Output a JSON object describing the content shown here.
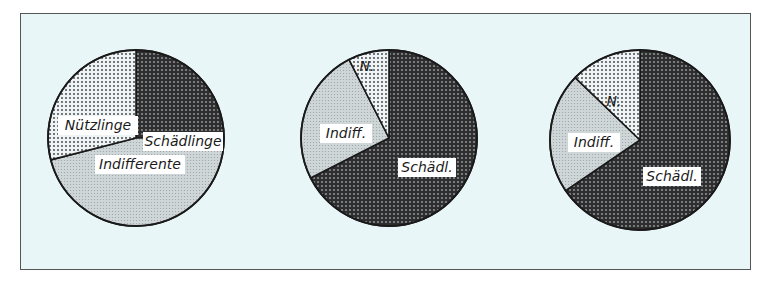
{
  "colors": {
    "background": "#e9f6f8",
    "frame_border": "#555555",
    "schaedlinge": "#4a4a4a",
    "indifferente": "#c9d0d2",
    "nuetzlinge": "#e6ecee",
    "outline": "#1a1a1a",
    "label_bg": "#ffffff"
  },
  "chart_data": [
    {
      "type": "pie",
      "title": "",
      "start_angle_deg": 0,
      "direction": "clockwise",
      "center": [
        136,
        138
      ],
      "radius": 88,
      "slices": [
        {
          "label": "Schädlinge",
          "value": 25,
          "pattern": "dark-dots"
        },
        {
          "label": "Indifferente",
          "value": 46,
          "pattern": "light-grey"
        },
        {
          "label": "Nützlinge",
          "value": 29,
          "pattern": "light-dots"
        }
      ]
    },
    {
      "type": "pie",
      "title": "",
      "start_angle_deg": 0,
      "direction": "clockwise",
      "center": [
        389,
        138
      ],
      "radius": 88,
      "slices": [
        {
          "label": "Schädl.",
          "value": 67.5,
          "pattern": "dark-dots"
        },
        {
          "label": "Indiff.",
          "value": 25,
          "pattern": "light-grey"
        },
        {
          "label": "N.",
          "value": 7.5,
          "pattern": "light-dots"
        }
      ]
    },
    {
      "type": "pie",
      "title": "",
      "start_angle_deg": 0,
      "direction": "clockwise",
      "center": [
        640,
        140
      ],
      "radius": 90,
      "slices": [
        {
          "label": "Schädl.",
          "value": 65.5,
          "pattern": "dark-dots"
        },
        {
          "label": "Indiff.",
          "value": 21.7,
          "pattern": "light-grey"
        },
        {
          "label": "N.",
          "value": 12.8,
          "pattern": "light-dots"
        }
      ]
    }
  ],
  "labels": {
    "pie1": {
      "schaedlinge": "Schädlinge",
      "indifferente": "Indifferente",
      "nuetzlinge": "Nützlinge"
    },
    "pie2": {
      "schaedl": "Schädl.",
      "indiff": "Indiff.",
      "n": "N."
    },
    "pie3": {
      "schaedl": "Schädl.",
      "indiff": "Indiff.",
      "n": "N."
    }
  }
}
